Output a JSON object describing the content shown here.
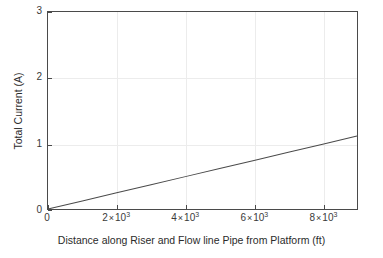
{
  "chart_data": {
    "type": "line",
    "title": "",
    "xlabel": "Distance along Riser and Flow line Pipe from Platform (ft)",
    "ylabel": "Total Current (A)",
    "xlim": [
      0,
      9000
    ],
    "ylim": [
      0,
      3
    ],
    "grid": true,
    "legend": null,
    "xticks": [
      0,
      2000,
      4000,
      6000,
      8000
    ],
    "xticklabels": [
      {
        "mantissa": "0",
        "times": "",
        "exponent": ""
      },
      {
        "mantissa": "2",
        "times": "×",
        "exponent": "3",
        "base": "10"
      },
      {
        "mantissa": "4",
        "times": "×",
        "exponent": "3",
        "base": "10"
      },
      {
        "mantissa": "6",
        "times": "×",
        "exponent": "3",
        "base": "10"
      },
      {
        "mantissa": "8",
        "times": "×",
        "exponent": "3",
        "base": "10"
      }
    ],
    "yticks": [
      0,
      1,
      2,
      3
    ],
    "yticklabels": [
      "0",
      "1",
      "2",
      "3"
    ],
    "series": [
      {
        "name": "Total Current",
        "color": "#4a4a4a",
        "linewidth": 1,
        "x": [
          0,
          1000,
          2000,
          3000,
          4000,
          5000,
          6000,
          7000,
          8000,
          9000
        ],
        "values": [
          0.0,
          0.123,
          0.247,
          0.37,
          0.493,
          0.617,
          0.74,
          0.863,
          0.987,
          1.11
        ]
      }
    ]
  },
  "style": {
    "background": "#ffffff",
    "axis_color": "#4a4a4a",
    "grid_color": "#ececec",
    "text_color": "#2b2b2b"
  }
}
